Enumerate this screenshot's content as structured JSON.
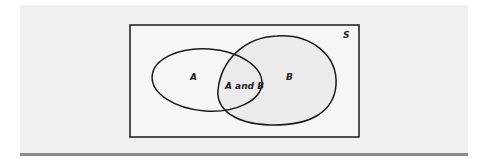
{
  "diagram": {
    "type": "venn",
    "universe_label": "S",
    "sets": [
      {
        "id": "A",
        "label": "A"
      },
      {
        "id": "B",
        "label": "B"
      }
    ],
    "intersection_label": "A and B",
    "colors": {
      "panel_background": "#f1f1f1",
      "universe_fill": "#f6f6f6",
      "set_b_fill": "#ebebeb",
      "stroke": "#1a1a1a",
      "rule": "#8a8a8a"
    }
  }
}
